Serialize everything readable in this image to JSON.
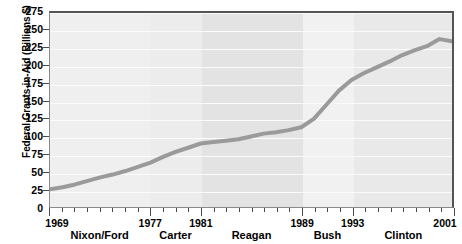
{
  "chart_data": {
    "type": "line",
    "title": "",
    "xlabel": "",
    "ylabel": "Federal Grants-in-Aid (Billions $)",
    "xlim": [
      1969,
      2001
    ],
    "ylim": [
      0,
      275
    ],
    "grid": true,
    "legend": "none",
    "y_ticks": [
      275,
      250,
      225,
      200,
      175,
      150,
      125,
      100,
      75,
      50,
      25,
      0
    ],
    "x_ticks": [
      1969,
      1977,
      1981,
      1989,
      1993,
      2001
    ],
    "x_tick_interval": 1,
    "series": [
      {
        "name": "Federal Grants-in-Aid",
        "color": "#9a9a9a",
        "x": [
          1969,
          1970,
          1971,
          1972,
          1973,
          1974,
          1975,
          1976,
          1977,
          1978,
          1979,
          1980,
          1981,
          1982,
          1983,
          1984,
          1985,
          1986,
          1987,
          1988,
          1989,
          1990,
          1991,
          1992,
          1993,
          1994,
          1995,
          1996,
          1997,
          1998,
          1999,
          2000,
          2001
        ],
        "values": [
          25,
          28,
          32,
          37,
          42,
          46,
          51,
          57,
          63,
          71,
          78,
          84,
          90,
          92,
          94,
          96,
          100,
          104,
          106,
          109,
          113,
          125,
          145,
          165,
          180,
          190,
          198,
          206,
          215,
          222,
          228,
          238,
          235
        ]
      }
    ],
    "eras": [
      {
        "name": "Nixon/Ford",
        "start": 1969,
        "end": 1977,
        "shade": "#efefef"
      },
      {
        "name": "Carter",
        "start": 1977,
        "end": 1981,
        "shade": "#ececec"
      },
      {
        "name": "Reagan",
        "start": 1981,
        "end": 1989,
        "shade": "#e3e3e3"
      },
      {
        "name": "Bush",
        "start": 1989,
        "end": 1993,
        "shade": "#f1f1f1"
      },
      {
        "name": "Clinton",
        "start": 1993,
        "end": 2001,
        "shade": "#e9e9e9"
      }
    ],
    "colors": {
      "plot_background": "#eeeeee",
      "line": "#9a9a9a",
      "frame": "#555555",
      "gridline": "#fbfbfb",
      "text": "#000000"
    }
  }
}
